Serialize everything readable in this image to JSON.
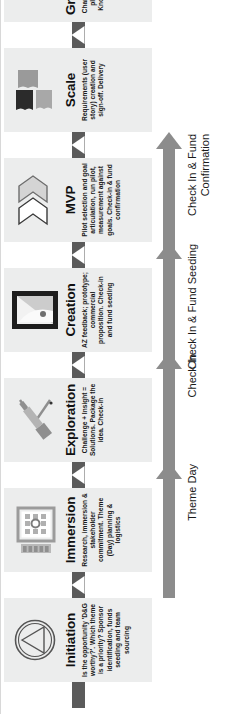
{
  "diagram": {
    "colors": {
      "stage_panel": "#eceded",
      "connector_bar": "#5b5b5b",
      "milestone_arrow": "#8c8c8c",
      "icon_dark": "#2e2e2e",
      "icon_mid": "#8f8f8f",
      "icon_light": "#c9c9c9",
      "text": "#1a1a1a",
      "background": "#ffffff"
    },
    "stages": [
      {
        "id": "initiation",
        "title": "Initiation",
        "description": "Is the opportunity 'D&G worthy?'. Which theme is a priority? Sponsor identification, funds seeding and team sourcing",
        "icon": "triangle-in-circle-icon"
      },
      {
        "id": "immersion",
        "title": "Immersion",
        "description": "Research, immersion & stakeholder commitment. Theme (Day) planning & logistics",
        "icon": "workshop-board-icon"
      },
      {
        "id": "exploration",
        "title": "Exploration",
        "description": "Challenge + Insight = Solutions. Package the idea. Check-in",
        "icon": "telescope-icon"
      },
      {
        "id": "creation",
        "title": "Creation",
        "description": "AZ feedback; prototype; commercial proposition. Check-in and fund seeding",
        "icon": "framed-canvas-icon"
      },
      {
        "id": "mvp",
        "title": "MVP",
        "description": "Pilot selection and goal articulation, run pilot, measurement against goals. Check-in & fund confirmation",
        "icon": "double-chevron-arrows-icon"
      },
      {
        "id": "scale",
        "title": "Scale",
        "description": "Requirements (user story) creation and sign-off. Delivery",
        "icon": "building-blocks-icon"
      },
      {
        "id": "graduation",
        "title": "Graduation",
        "description": "Change management plan. Hand-over. Knowledge transfer",
        "icon": "flag-on-globe-icon"
      }
    ],
    "milestones": [
      {
        "id": "theme-day",
        "label": "Theme Day"
      },
      {
        "id": "check-in",
        "label": "Check In"
      },
      {
        "id": "check-in-fund-seeding",
        "label": "Check In & Fund\nSeeding"
      },
      {
        "id": "check-in-fund-confirmation",
        "label": "Check In & Fund\nConfirmation"
      }
    ]
  }
}
